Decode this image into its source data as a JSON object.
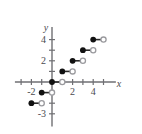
{
  "figure": {
    "background_color": "#ffffff",
    "axis_color": "#6f6f73",
    "closed_point_color": "#111111",
    "open_point_color": "#ffffff",
    "segment_color": "#2b2b2b"
  },
  "axes": {
    "x_label": "x",
    "y_label": "y",
    "x_tick_labels": [
      "-2",
      "2",
      "4"
    ],
    "y_tick_labels": [
      "4",
      "2",
      "-3"
    ],
    "x_ticks_values": [
      -3,
      -2,
      -1,
      1,
      2,
      3,
      4,
      5
    ],
    "y_ticks_values": [
      4,
      3,
      2,
      1,
      -1,
      -2,
      -3
    ],
    "x_labeled_values": [
      -2,
      2,
      4
    ],
    "y_labeled_values": [
      4,
      2,
      -3
    ],
    "x_range": [
      -3.6,
      6.2
    ],
    "y_range": [
      -4.2,
      5.2
    ],
    "origin_label": ""
  },
  "chart_data": {
    "type": "scatter",
    "title": "",
    "subtitle": "",
    "xlabel": "x",
    "ylabel": "y",
    "xlim": [
      -3.6,
      6.2
    ],
    "ylim": [
      -4.2,
      5.2
    ],
    "grid": false,
    "legend": "none",
    "segments": [
      {
        "x_start": -2,
        "x_end": -1,
        "y": -2,
        "left_endpoint": "closed",
        "right_endpoint": "open"
      },
      {
        "x_start": -1,
        "x_end": 0,
        "y": -1,
        "left_endpoint": "closed",
        "right_endpoint": "open"
      },
      {
        "x_start": 0,
        "x_end": 1,
        "y": 0,
        "left_endpoint": "closed",
        "right_endpoint": "open"
      },
      {
        "x_start": 1,
        "x_end": 2,
        "y": 1,
        "left_endpoint": "closed",
        "right_endpoint": "open"
      },
      {
        "x_start": 2,
        "x_end": 3,
        "y": 2,
        "left_endpoint": "closed",
        "right_endpoint": "open"
      },
      {
        "x_start": 3,
        "x_end": 4,
        "y": 3,
        "left_endpoint": "closed",
        "right_endpoint": "open"
      },
      {
        "x_start": 4,
        "x_end": 5,
        "y": 4,
        "left_endpoint": "closed",
        "right_endpoint": "open"
      }
    ],
    "closed_points": [
      {
        "x": -2,
        "y": -2
      },
      {
        "x": -1,
        "y": -1
      },
      {
        "x": 0,
        "y": 0
      },
      {
        "x": 1,
        "y": 1
      },
      {
        "x": 2,
        "y": 2
      },
      {
        "x": 3,
        "y": 3
      },
      {
        "x": 4,
        "y": 4
      }
    ],
    "open_points": [
      {
        "x": -1,
        "y": -2
      },
      {
        "x": 0,
        "y": -1
      },
      {
        "x": 1,
        "y": 0
      },
      {
        "x": 2,
        "y": 1
      },
      {
        "x": 3,
        "y": 2
      },
      {
        "x": 4,
        "y": 3
      },
      {
        "x": 5,
        "y": 4
      }
    ]
  }
}
